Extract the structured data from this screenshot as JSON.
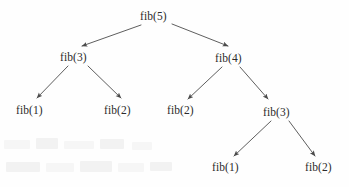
{
  "diagram": {
    "type": "recursion-tree",
    "background_color": "#fefefe",
    "text_color": "#2b2b2b",
    "edge_color": "#555555",
    "nodes": [
      {
        "id": "n0",
        "label": "fib(5)",
        "level": 0,
        "x": 156,
        "y": 16
      },
      {
        "id": "n1",
        "label": "fib(3)",
        "level": 1,
        "x": 76,
        "y": 57
      },
      {
        "id": "n2",
        "label": "fib(4)",
        "level": 1,
        "x": 231,
        "y": 58
      },
      {
        "id": "n3",
        "label": "fib(1)",
        "level": 2,
        "x": 32,
        "y": 110
      },
      {
        "id": "n4",
        "label": "fib(2)",
        "level": 2,
        "x": 120,
        "y": 110
      },
      {
        "id": "n5",
        "label": "fib(2)",
        "level": 2,
        "x": 183,
        "y": 110
      },
      {
        "id": "n6",
        "label": "fib(3)",
        "level": 2,
        "x": 279,
        "y": 112
      },
      {
        "id": "n7",
        "label": "fib(1)",
        "level": 3,
        "x": 228,
        "y": 167
      },
      {
        "id": "n8",
        "label": "fib(2)",
        "level": 3,
        "x": 321,
        "y": 167
      }
    ],
    "edges": [
      {
        "from": "n0",
        "to": "n1",
        "x1": 141,
        "y1": 25,
        "x2": 82,
        "y2": 46
      },
      {
        "from": "n0",
        "to": "n2",
        "x1": 172,
        "y1": 24,
        "x2": 228,
        "y2": 46
      },
      {
        "from": "n1",
        "to": "n3",
        "x1": 68,
        "y1": 66,
        "x2": 37,
        "y2": 98
      },
      {
        "from": "n1",
        "to": "n4",
        "x1": 88,
        "y1": 66,
        "x2": 121,
        "y2": 98
      },
      {
        "from": "n2",
        "to": "n5",
        "x1": 222,
        "y1": 67,
        "x2": 188,
        "y2": 99
      },
      {
        "from": "n2",
        "to": "n6",
        "x1": 240,
        "y1": 67,
        "x2": 268,
        "y2": 99
      },
      {
        "from": "n6",
        "to": "n7",
        "x1": 271,
        "y1": 121,
        "x2": 234,
        "y2": 156
      },
      {
        "from": "n6",
        "to": "n8",
        "x1": 289,
        "y1": 121,
        "x2": 315,
        "y2": 156
      }
    ]
  }
}
